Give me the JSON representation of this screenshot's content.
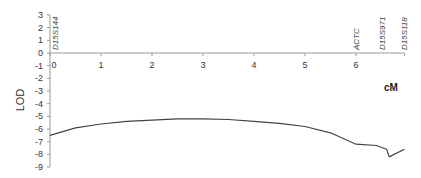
{
  "chart_data": {
    "type": "line",
    "title": "",
    "xlabel": "cM",
    "ylabel": "LOD",
    "xlim": [
      0,
      6.95
    ],
    "ylim": [
      -9,
      3
    ],
    "x_ticks": [
      0,
      1,
      2,
      3,
      4,
      5,
      6
    ],
    "y_ticks": [
      3,
      2,
      1,
      0,
      -1,
      -2,
      -3,
      -4,
      -5,
      -6,
      -7,
      -8,
      -9
    ],
    "grid": false,
    "legend": null,
    "markers": [
      {
        "label": "D15S144",
        "x": 0.1
      },
      {
        "label": "ACTC",
        "x": 6.0
      },
      {
        "label": "D15S971",
        "x": 6.5
      },
      {
        "label": "D15S118",
        "x": 6.95
      }
    ],
    "series": [
      {
        "name": "LOD",
        "x": [
          0,
          0.5,
          1,
          1.5,
          2,
          2.5,
          3,
          3.5,
          4,
          4.5,
          5,
          5.5,
          6,
          6.4,
          6.6,
          6.65,
          6.95
        ],
        "y": [
          -6.5,
          -5.9,
          -5.6,
          -5.4,
          -5.3,
          -5.2,
          -5.2,
          -5.25,
          -5.4,
          -5.55,
          -5.8,
          -6.3,
          -7.2,
          -7.3,
          -7.6,
          -8.2,
          -7.6
        ]
      }
    ]
  }
}
